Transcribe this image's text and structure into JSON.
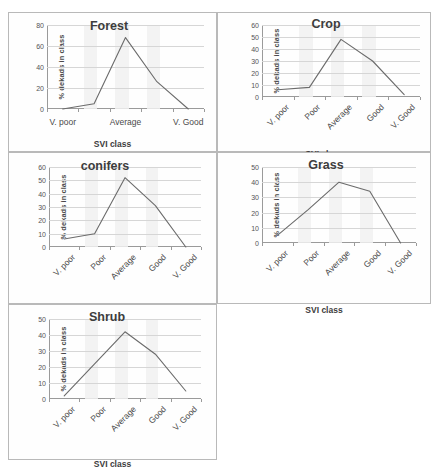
{
  "figure": {
    "background": "#ffffff",
    "panel_border": "#b9b9b9",
    "line_color": "#6b6b6b",
    "grid_color": "#d6d6d6",
    "band_color": "#f1f1f1",
    "axis_title_x": "SVI class",
    "axis_title_y": "% dekads in class"
  },
  "chart_data": [
    {
      "id": "forest",
      "type": "line",
      "title": "Forest",
      "xlabel": "SVI class",
      "ylabel": "% dekads in class",
      "categories": [
        "V. poor",
        "Poor",
        "Average",
        "Good",
        "V. Good"
      ],
      "visible_tick_labels": [
        "V. poor",
        "",
        "Average",
        "",
        "V. Good"
      ],
      "label_orientation": "horizontal",
      "values": [
        0,
        5,
        68,
        26,
        0
      ],
      "ylim": [
        0,
        80
      ],
      "yticks": [
        0,
        20,
        40,
        60,
        80
      ],
      "grid": true,
      "legend": "none"
    },
    {
      "id": "crop",
      "type": "line",
      "title": "Crop",
      "xlabel": "SVI class",
      "ylabel": "% dekads in class",
      "categories": [
        "V. poor",
        "Poor",
        "Average",
        "Good",
        "V. Good"
      ],
      "visible_tick_labels": [
        "V. poor",
        "Poor",
        "Average",
        "Good",
        "V. Good"
      ],
      "label_orientation": "rotated",
      "values": [
        6,
        8,
        48,
        30,
        2
      ],
      "ylim": [
        0,
        60
      ],
      "yticks": [
        0,
        10,
        20,
        30,
        40,
        50,
        60
      ],
      "grid": true,
      "legend": "none"
    },
    {
      "id": "conifers",
      "type": "line",
      "title": "conifers",
      "xlabel": "SVI class",
      "ylabel": "% dekads in class",
      "categories": [
        "V. poor",
        "Poor",
        "Average",
        "Good",
        "V. Good"
      ],
      "visible_tick_labels": [
        "V. poor",
        "Poor",
        "Average",
        "Good",
        "V. Good"
      ],
      "label_orientation": "rotated",
      "values": [
        6,
        10,
        52,
        31,
        0
      ],
      "ylim": [
        0,
        60
      ],
      "yticks": [
        0,
        10,
        20,
        30,
        40,
        50,
        60
      ],
      "grid": true,
      "legend": "none"
    },
    {
      "id": "grass",
      "type": "line",
      "title": "Grass",
      "xlabel": "SVI class",
      "ylabel": "% dekads in class",
      "categories": [
        "V. poor",
        "Poor",
        "Average",
        "Good",
        "V. Good"
      ],
      "visible_tick_labels": [
        "V. poor",
        "Poor",
        "Average",
        "Good",
        "V. Good"
      ],
      "label_orientation": "rotated",
      "values": [
        5,
        22,
        40,
        34,
        0
      ],
      "ylim": [
        0,
        50
      ],
      "yticks": [
        0,
        10,
        20,
        30,
        40,
        50
      ],
      "grid": true,
      "legend": "none"
    },
    {
      "id": "shrub",
      "type": "line",
      "title": "Shrub",
      "xlabel": "SVI class",
      "ylabel": "% dekads in class",
      "categories": [
        "V. poor",
        "Poor",
        "Average",
        "Good",
        "V. Good"
      ],
      "visible_tick_labels": [
        "V. poor",
        "Poor",
        "Average",
        "Good",
        "V. Good"
      ],
      "label_orientation": "rotated",
      "values": [
        2,
        22,
        42,
        28,
        5
      ],
      "ylim": [
        0,
        50
      ],
      "yticks": [
        0,
        10,
        20,
        30,
        40,
        50
      ],
      "grid": true,
      "legend": "none"
    }
  ]
}
